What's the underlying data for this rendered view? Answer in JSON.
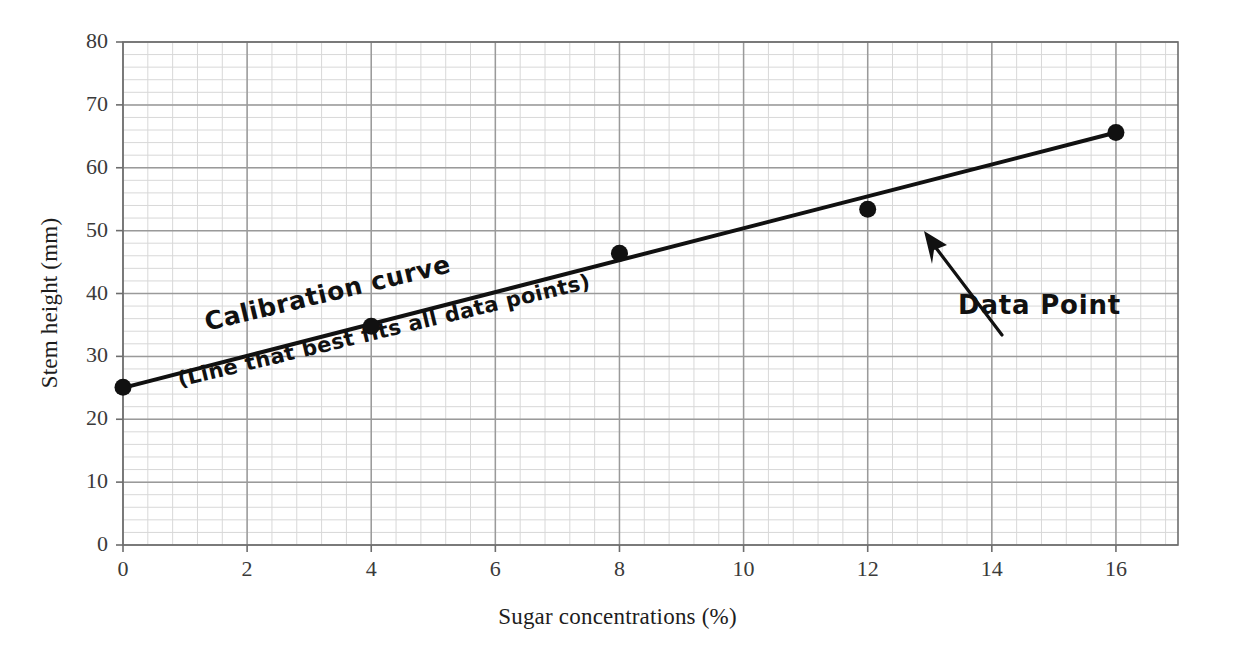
{
  "chart_data": {
    "type": "scatter",
    "title": "",
    "xlabel": "Sugar concentrations (%)",
    "ylabel": "Stem height (mm)",
    "xlim": [
      0,
      17
    ],
    "ylim": [
      0,
      80
    ],
    "xticks": [
      "0",
      "2",
      "4",
      "6",
      "8",
      "10",
      "12",
      "14",
      "16"
    ],
    "xtick_values": [
      0,
      2,
      4,
      6,
      8,
      10,
      12,
      14,
      16
    ],
    "yticks": [
      "0",
      "10",
      "20",
      "30",
      "40",
      "50",
      "60",
      "70",
      "80"
    ],
    "ytick_values": [
      0,
      10,
      20,
      30,
      40,
      50,
      60,
      70,
      80
    ],
    "grid": true,
    "grid_major_step_x": 2,
    "grid_major_step_y": 10,
    "grid_minor_step_x": 0.4,
    "grid_minor_step_y": 2,
    "legend": "none",
    "series": [
      {
        "name": "Data points",
        "marker": "filled-circle",
        "x": [
          0,
          4,
          8,
          12,
          16
        ],
        "values": [
          25.1,
          34.8,
          46.4,
          53.4,
          65.6
        ]
      },
      {
        "name": "Calibration curve",
        "type": "line",
        "x": [
          0,
          16
        ],
        "values": [
          25.0,
          65.6
        ]
      }
    ],
    "annotations": [
      {
        "name": "calibration-curve",
        "text": "Calibration curve",
        "x": 3.0,
        "y": 38.5,
        "rotation_deg": -13.5
      },
      {
        "name": "best-fit-note",
        "text": "(Line that best fits all data points)",
        "x": 2.5,
        "y": 29.5,
        "rotation_deg": -13.5
      },
      {
        "name": "data-point-callout",
        "text": "Data Point",
        "x": 13.5,
        "y": 39.0,
        "arrow_from": [
          13.1,
          41.5
        ],
        "arrow_to": [
          12.2,
          49.8
        ]
      }
    ]
  },
  "colors": {
    "background": "#ffffff",
    "axis": "#6d6d6d",
    "grid_major": "#9a9a9a",
    "grid_minor": "#d8d8d8",
    "data": "#111111",
    "line": "#111111",
    "text": "#2b2b2b",
    "annotation": "#111111"
  }
}
